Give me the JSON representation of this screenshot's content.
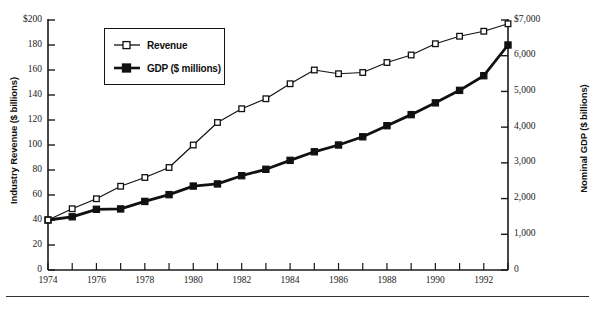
{
  "legend": {
    "position": "upper-left-inside",
    "items": [
      {
        "label": "Revenue",
        "marker": "open-square",
        "color": "#111111"
      },
      {
        "label": "GDP ($ millions)",
        "marker": "filled-square",
        "color": "#111111"
      }
    ]
  },
  "axes": {
    "left_title": "Industry Revenue ($ billions)",
    "right_title": "Nominal GDP ($ billions)",
    "left_ticks": [
      "$200",
      "180",
      "160",
      "140",
      "120",
      "100",
      "80",
      "60",
      "40",
      "20",
      "0"
    ],
    "right_ticks": [
      "$7,000",
      "6,000",
      "5,000",
      "4,000",
      "3,000",
      "2,000",
      "1,000",
      "0"
    ],
    "x_ticks": [
      "1974",
      "1976",
      "1978",
      "1980",
      "1982",
      "1984",
      "1986",
      "1988",
      "1990",
      "1992"
    ]
  },
  "chart_data": {
    "type": "line",
    "title": "",
    "xlabel": "",
    "ylabel": "Industry Revenue ($ billions)",
    "y2label": "Nominal GDP ($ billions)",
    "grid": false,
    "legend_position": "upper left",
    "xlim": [
      1974,
      1993
    ],
    "ylim": [
      0,
      200
    ],
    "y2lim": [
      0,
      7000
    ],
    "x": [
      1974,
      1975,
      1976,
      1977,
      1978,
      1979,
      1980,
      1981,
      1982,
      1983,
      1984,
      1985,
      1986,
      1987,
      1988,
      1989,
      1990,
      1991,
      1992,
      1993
    ],
    "series": [
      {
        "name": "Revenue",
        "axis": "left",
        "units": "$ billions",
        "marker": "open-square",
        "values": [
          40,
          49,
          57,
          67,
          74,
          82,
          100,
          118,
          129,
          137,
          149,
          160,
          157,
          158,
          166,
          172,
          181,
          187,
          191,
          197
        ]
      },
      {
        "name": "GDP ($ millions)",
        "axis": "right",
        "units": "$ billions",
        "marker": "filled-square",
        "values": [
          1400,
          1490,
          1700,
          1710,
          1920,
          2110,
          2350,
          2410,
          2640,
          2820,
          3070,
          3310,
          3500,
          3730,
          4040,
          4350,
          4680,
          5030,
          5440,
          6300
        ]
      }
    ]
  }
}
